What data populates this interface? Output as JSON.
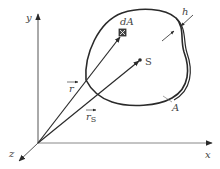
{
  "diagram": {
    "type": "3d-coordinate-surface-diagram",
    "axes": {
      "x_label": "x",
      "y_label": "y",
      "z_label": "z"
    },
    "labels": {
      "area_element": "dA",
      "centroid": "S",
      "position_vector": "r",
      "centroid_vector_base": "r",
      "centroid_vector_sub": "S",
      "thickness": "h",
      "area": "A"
    },
    "colors": {
      "line": "#2a2a2a",
      "axis": "#555555",
      "text": "#444444",
      "background": "#ffffff"
    }
  }
}
